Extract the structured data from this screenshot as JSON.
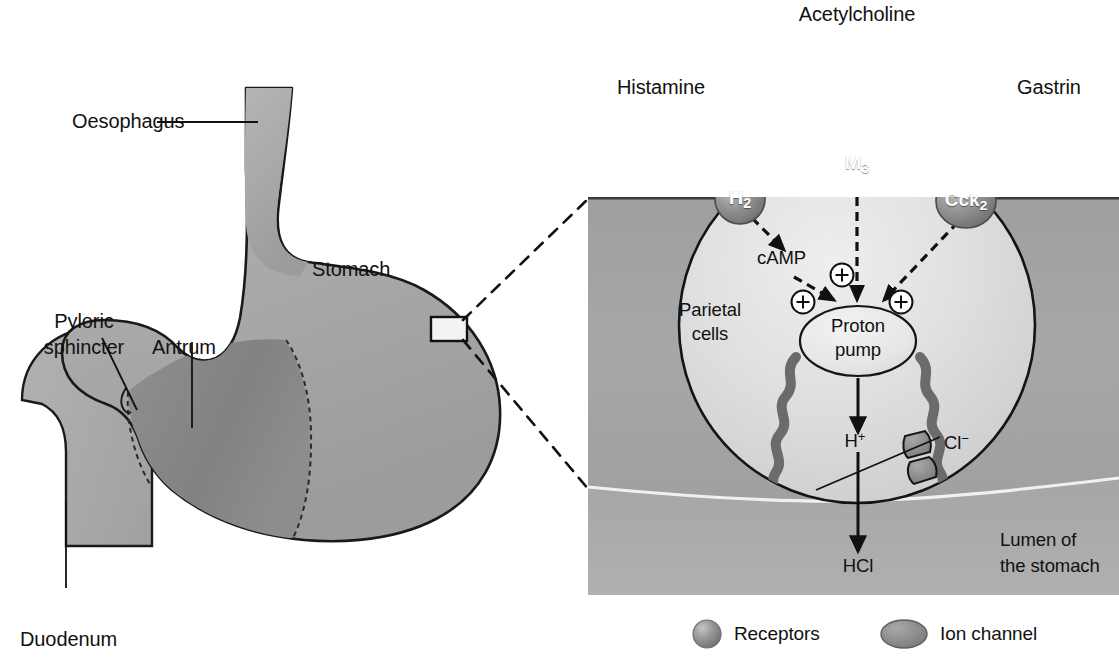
{
  "figure": {
    "background": "#ffffff"
  },
  "colors": {
    "stomach_wall": "#a9a9a9",
    "antrum_fill": "#8a8a8a",
    "outline": "#1a1a1a",
    "tissue_upper": "#a3a3a3",
    "lumen": "#9a9a9a",
    "cell_fill": "#d9d9d9",
    "receptor_fill": "#8c8c8c",
    "ion_channel_fill": "#8a8a8a",
    "canaliculus": "#6b6b6b",
    "text": "#111111"
  },
  "left_panel": {
    "name": "stomach-anatomy",
    "labels": [
      {
        "id": "oesophagus",
        "text": "Oesophagus"
      },
      {
        "id": "stomach",
        "text": "Stomach"
      },
      {
        "id": "pyloric_sphincter",
        "text": "Pyloric\nsphincter"
      },
      {
        "id": "pyloric_sphincter_line1",
        "text": "Pyloric"
      },
      {
        "id": "pyloric_sphincter_line2",
        "text": "sphincter"
      },
      {
        "id": "antrum",
        "text": "Antrum"
      },
      {
        "id": "duodenum",
        "text": "Duodenum"
      }
    ],
    "magnifier_box": {
      "label": "magnification-region"
    }
  },
  "right_panel": {
    "name": "parietal-cell-detail",
    "ligands": [
      {
        "id": "histamine",
        "label": "Histamine",
        "sign": "+",
        "receptor": "H2"
      },
      {
        "id": "acetylcholine",
        "label": "Acetylcholine",
        "sign": "+",
        "receptor": "M3"
      },
      {
        "id": "gastrin",
        "label": "Gastrin",
        "sign": "+",
        "receptor": "Cck2"
      }
    ],
    "receptors": [
      {
        "id": "h2",
        "name": "H",
        "subscript": "2"
      },
      {
        "id": "m3",
        "name": "M",
        "subscript": "3"
      },
      {
        "id": "cck2",
        "name": "Cck",
        "subscript": "2"
      }
    ],
    "second_messenger": {
      "id": "camp",
      "label": "cAMP"
    },
    "cell_label_line1": "Parietal",
    "cell_label_line2": "cells",
    "pump_line1": "Proton",
    "pump_line2": "pump",
    "ions": [
      {
        "id": "h_plus",
        "symbol": "H",
        "charge": "+"
      },
      {
        "id": "cl_minus",
        "symbol": "Cl",
        "charge": "−"
      }
    ],
    "product": {
      "id": "hcl",
      "label": "HCl"
    },
    "lumen_line1": "Lumen of",
    "lumen_line2": "the stomach",
    "plus_signs": [
      {
        "id": "plus-histamine"
      },
      {
        "id": "plus-acetylcholine"
      },
      {
        "id": "plus-gastrin"
      },
      {
        "id": "plus-camp-pump"
      },
      {
        "id": "plus-m3-pump"
      },
      {
        "id": "plus-cck2-pump"
      }
    ]
  },
  "legend": {
    "name": "legend",
    "items": [
      {
        "id": "receptors",
        "label": "Receptors",
        "shape": "sphere"
      },
      {
        "id": "ion_channel",
        "label": "Ion channel",
        "shape": "ellipse"
      }
    ]
  }
}
